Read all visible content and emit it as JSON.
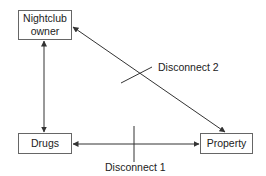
{
  "nodes": {
    "owner": {
      "label_line1": "Nightclub",
      "label_line2": "owner"
    },
    "drugs": {
      "label": "Drugs"
    },
    "property": {
      "label": "Property"
    }
  },
  "disconnects": {
    "d1": {
      "label": "Disconnect 1"
    },
    "d2": {
      "label": "Disconnect 2"
    }
  },
  "edges": [
    {
      "from": "owner",
      "to": "drugs",
      "bidirectional": true
    },
    {
      "from": "drugs",
      "to": "property",
      "bidirectional": true,
      "disconnect": "Disconnect 1"
    },
    {
      "from": "owner",
      "to": "property",
      "bidirectional": true,
      "disconnect": "Disconnect 2"
    }
  ]
}
